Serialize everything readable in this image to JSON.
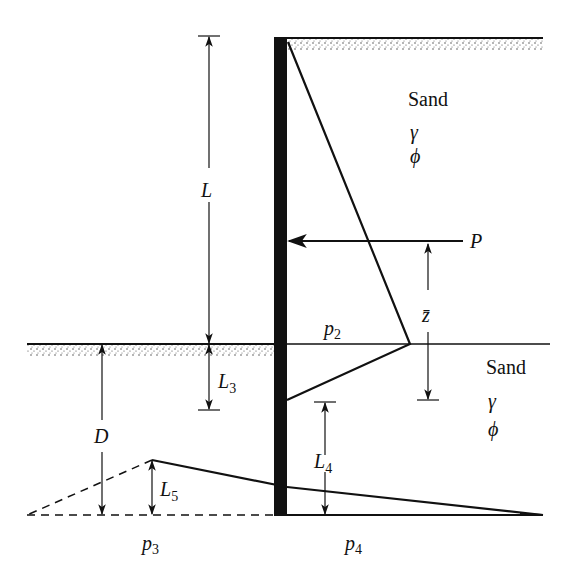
{
  "diagram": {
    "upper_layer": {
      "material": "Sand",
      "unit_weight": "γ",
      "friction_angle": "ϕ"
    },
    "lower_layer": {
      "material": "Sand",
      "unit_weight": "γ",
      "friction_angle": "ϕ"
    },
    "dimensions": {
      "L": "L",
      "L3": {
        "base": "L",
        "sub": "3"
      },
      "L4": {
        "base": "L",
        "sub": "4"
      },
      "L5": {
        "base": "L",
        "sub": "5"
      },
      "D": "D",
      "z_bar": "z̄"
    },
    "force": {
      "label": "P"
    },
    "pressures": {
      "p2": {
        "base": "p",
        "sub": "2"
      },
      "p3": {
        "base": "p",
        "sub": "3"
      },
      "p4": {
        "base": "p",
        "sub": "4"
      }
    },
    "colors": {
      "ink": "#111111",
      "background": "#ffffff"
    }
  }
}
